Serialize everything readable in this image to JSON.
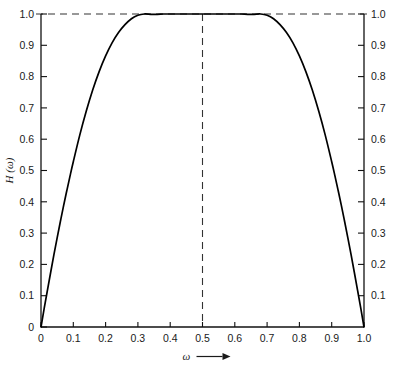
{
  "chart_data": {
    "type": "line",
    "title": "",
    "xlabel": "ω",
    "xlabel_arrow": "⟶",
    "ylabel": "H (ω)",
    "xlim": [
      0,
      1
    ],
    "ylim": [
      0,
      1
    ],
    "grid": false,
    "legend": null,
    "x_ticks": [
      "0",
      "0.1",
      "0.2",
      "0.3",
      "0.4",
      "0.5",
      "0.6",
      "0.7",
      "0.8",
      "0.9",
      "1.0"
    ],
    "x_tick_values": [
      0,
      0.1,
      0.2,
      0.3,
      0.4,
      0.5,
      0.6,
      0.7,
      0.8,
      0.9,
      1.0
    ],
    "y_ticks_left": [
      "0",
      "0.1",
      "0.2",
      "0.3",
      "0.4",
      "0.5",
      "0.6",
      "0.7",
      "0.8",
      "0.9",
      "1.0"
    ],
    "y_tick_values_left": [
      0,
      0.1,
      0.2,
      0.3,
      0.4,
      0.5,
      0.6,
      0.7,
      0.8,
      0.9,
      1.0
    ],
    "y_ticks_right": [
      "0.1",
      "0.2",
      "0.3",
      "0.4",
      "0.5",
      "0.6",
      "0.7",
      "0.8",
      "0.9",
      "1.0"
    ],
    "y_tick_values_right": [
      0.1,
      0.2,
      0.3,
      0.4,
      0.5,
      0.6,
      0.7,
      0.8,
      0.9,
      1.0
    ],
    "series": [
      {
        "name": "H(ω)",
        "color": "#000000",
        "x": [
          0.0,
          0.01,
          0.02,
          0.03,
          0.04,
          0.05,
          0.06,
          0.07,
          0.08,
          0.09,
          0.1,
          0.12,
          0.14,
          0.16,
          0.18,
          0.2,
          0.22,
          0.24,
          0.26,
          0.28,
          0.3,
          0.32,
          0.34,
          0.36,
          0.38,
          0.4,
          0.42,
          0.44,
          0.46,
          0.48,
          0.5,
          0.52,
          0.54,
          0.56,
          0.58,
          0.6,
          0.62,
          0.64,
          0.66,
          0.68,
          0.7,
          0.72,
          0.74,
          0.76,
          0.78,
          0.8,
          0.82,
          0.84,
          0.86,
          0.88,
          0.9,
          0.91,
          0.92,
          0.93,
          0.94,
          0.95,
          0.96,
          0.97,
          0.98,
          0.99,
          1.0
        ],
        "y": [
          0.0,
          0.06,
          0.118,
          0.175,
          0.231,
          0.285,
          0.337,
          0.388,
          0.436,
          0.483,
          0.528,
          0.613,
          0.689,
          0.757,
          0.816,
          0.866,
          0.908,
          0.941,
          0.966,
          0.985,
          0.996,
          1.0,
          0.999,
          0.999,
          1.0,
          1.0,
          1.0,
          1.0,
          1.0,
          1.0,
          1.0,
          1.0,
          1.0,
          1.0,
          1.0,
          1.0,
          1.0,
          0.999,
          0.999,
          1.0,
          0.996,
          0.985,
          0.966,
          0.941,
          0.908,
          0.866,
          0.816,
          0.757,
          0.689,
          0.613,
          0.528,
          0.483,
          0.436,
          0.388,
          0.337,
          0.285,
          0.231,
          0.175,
          0.118,
          0.06,
          0.0
        ]
      }
    ],
    "annotations": [
      {
        "name": "peak-horizontal-guide",
        "type": "hline",
        "value": 1.0,
        "style": "dashed"
      },
      {
        "name": "peak-vertical-guide",
        "type": "vline",
        "value": 0.5,
        "style": "dashed"
      }
    ],
    "peak": {
      "x": 0.5,
      "y": 1.0
    }
  },
  "colors": {
    "curve": "#000000",
    "axis": "#111111",
    "dashed": "#333333",
    "text": "#1a1a1a",
    "background": "#ffffff"
  }
}
